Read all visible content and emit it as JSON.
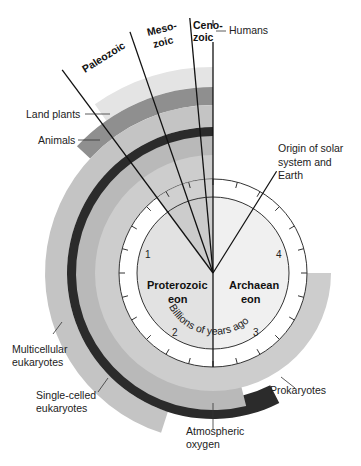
{
  "diagram": {
    "center": [
      213,
      273
    ],
    "colors": {
      "land_plants": "#e4e4e4",
      "animals": "#8f8f8f",
      "multicellular": "#c4c4c4",
      "single_celled": "#2b2b2b",
      "prokaryotes": "#cdcdcd",
      "oxygen": "#b9b9b9",
      "proterozoic_fill": "#e2e2e2",
      "archaean_fill": "#f0f0f0",
      "phanerozoic_wedge": "#c8c8c8",
      "line": "#111111"
    },
    "bands": [
      {
        "name": "land-plants-band",
        "label": "Land plants",
        "r_in": 186,
        "r_out": 206,
        "start_deg": 0,
        "end_deg": 35,
        "color_key": "land_plants"
      },
      {
        "name": "animals-band",
        "label": "Animals",
        "r_in": 168,
        "r_out": 186,
        "start_deg": 0,
        "end_deg": 47,
        "color_key": "animals"
      },
      {
        "name": "multicellular-band",
        "label": "Multicellular eukaryotes",
        "r_in": 146,
        "r_out": 168,
        "start_deg": 0,
        "end_deg": 162,
        "color_key": "multicellular"
      },
      {
        "name": "single-celled-band",
        "label": "Single-celled eukaryotes",
        "r_in": 126,
        "r_out": 146,
        "start_deg": 0,
        "end_deg": 207,
        "color_key": "single_celled"
      },
      {
        "name": "oxygen-band",
        "label": "Atmospheric oxygen",
        "r_in": 108,
        "r_out": 137,
        "start_deg": 0,
        "end_deg": 194,
        "color_key": "oxygen"
      },
      {
        "name": "prokaryotes-band",
        "label": "Prokaryotes",
        "r_in": 94,
        "r_out": 118,
        "start_deg": 0,
        "end_deg": 270,
        "color_key": "prokaryotes"
      }
    ],
    "tick_ring": {
      "r_outer": 94,
      "r_inner": 76,
      "tick_count": 24,
      "tick_len": 6
    },
    "eons": [
      {
        "name": "Proterozoic eon",
        "line1": "Proterozoic",
        "line2": "eon"
      },
      {
        "name": "Archaean eon",
        "line1": "Archaean",
        "line2": "eon"
      }
    ],
    "scale_label": "Billions of years ago",
    "numbers": [
      {
        "text": "1",
        "x": 120,
        "y": 255
      },
      {
        "text": "2",
        "x": 172,
        "y": 335
      },
      {
        "text": "3",
        "x": 253,
        "y": 335
      },
      {
        "text": "4",
        "x": 277,
        "y": 255
      }
    ],
    "era_lines": [
      {
        "name": "paleozoic-start-line",
        "deg": 36.6,
        "len": 253
      },
      {
        "name": "paleozoic-mesozoic-line",
        "deg": 19,
        "len": 255
      },
      {
        "name": "mesozoic-cenozoic-line",
        "deg": 5.2,
        "len": 256
      },
      {
        "name": "cenozoic-line",
        "deg": 0,
        "len": 231
      }
    ],
    "eras": [
      {
        "name": "Paleozoic",
        "text": "Paleozoic",
        "x": 108,
        "y": 60,
        "rot": -30
      },
      {
        "name": "Mesozoic",
        "text1": "Meso-",
        "text2": "zoic",
        "x": 148,
        "y": 34,
        "rot": -12
      },
      {
        "name": "Cenozoic",
        "text1": "Ceno-",
        "text2": "zoic",
        "x": 195,
        "y": 26,
        "rot": 0
      }
    ],
    "origin_line": {
      "deg": -32,
      "len": 120
    },
    "labels": {
      "humans": "Humans",
      "land_plants": "Land plants",
      "animals": "Animals",
      "origin": [
        "Origin of solar",
        "system and",
        "Earth"
      ],
      "multicellular": [
        "Multicellular",
        "eukaryotes"
      ],
      "single_celled": [
        "Single-celled",
        "eukaryotes"
      ],
      "prokaryotes": "Prokaryotes",
      "oxygen": [
        "Atmospheric",
        "oxygen"
      ]
    }
  }
}
